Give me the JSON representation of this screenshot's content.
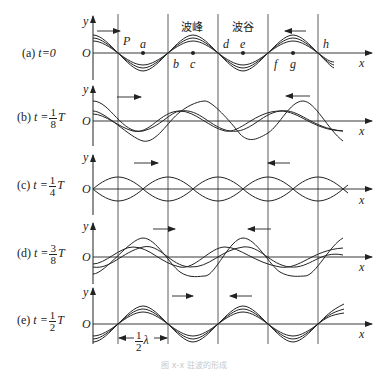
{
  "figure": {
    "caption": "图 x-x  驻波的形成",
    "axis_labels": {
      "y": "y",
      "x": "x",
      "origin": "O"
    },
    "region_labels": {
      "crest": "波峰",
      "trough": "波谷"
    },
    "point_labels": [
      "P",
      "a",
      "b",
      "c",
      "d",
      "e",
      "f",
      "g",
      "h"
    ],
    "half_wavelength_label": {
      "frac_num": "1",
      "frac_den": "2",
      "symbol": "λ"
    },
    "panels": [
      {
        "id": "a",
        "prefix": "(a) ",
        "t_label": "t=0",
        "has_fraction": false,
        "frac_num": "",
        "frac_den": "",
        "suffix": ""
      },
      {
        "id": "b",
        "prefix": "(b) ",
        "t_label": "t =",
        "has_fraction": true,
        "frac_num": "1",
        "frac_den": "8",
        "suffix": "T"
      },
      {
        "id": "c",
        "prefix": "(c) ",
        "t_label": "t =",
        "has_fraction": true,
        "frac_num": "1",
        "frac_den": "4",
        "suffix": "T"
      },
      {
        "id": "d",
        "prefix": "(d) ",
        "t_label": "t =",
        "has_fraction": true,
        "frac_num": "3",
        "frac_den": "8",
        "suffix": "T"
      },
      {
        "id": "e",
        "prefix": "(e) ",
        "t_label": "t =",
        "has_fraction": true,
        "frac_num": "1",
        "frac_den": "2",
        "suffix": "T"
      }
    ],
    "colors": {
      "line": "#222222",
      "grid": "#333333",
      "caption": "#c8c8c8"
    }
  }
}
